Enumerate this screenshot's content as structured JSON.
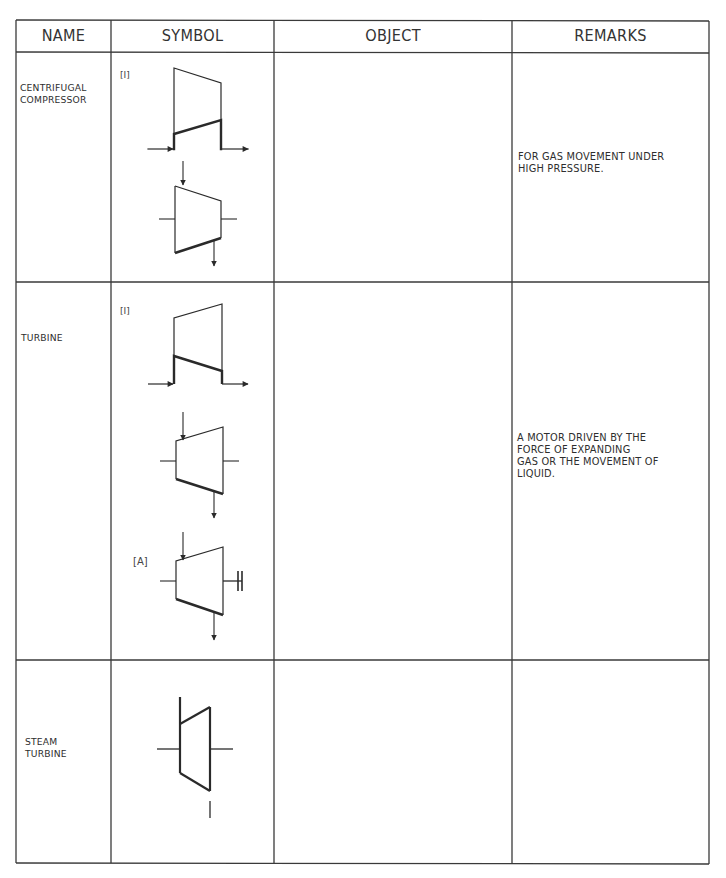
{
  "table": {
    "headers": {
      "name": "NAME",
      "symbol": "SYMBOL",
      "object": "OBJECT",
      "remarks": "REMARKS"
    },
    "rows": [
      {
        "name": "CENTRIFUGAL\nCOMPRESSOR",
        "symbol_tags": [
          "[I]"
        ],
        "object": "",
        "remarks": "FOR GAS MOVEMENT UNDER\nHIGH PRESSURE."
      },
      {
        "name": "TURBINE",
        "symbol_tags": [
          "[I]",
          "[A]"
        ],
        "object": "",
        "remarks": "A MOTOR DRIVEN BY THE\nFORCE OF EXPANDING\nGAS OR THE MOVEMENT OF\nLIQUID."
      },
      {
        "name": "STEAM\nTURBINE",
        "symbol_tags": [],
        "object": "",
        "remarks": ""
      }
    ]
  },
  "symbols": {
    "centrifugal_compressor": [
      "compressor-flow-symbol",
      "compressor-stub-symbol"
    ],
    "turbine": [
      "turbine-flow-symbol",
      "turbine-stub-symbol",
      "turbine-shaft-coupling-symbol"
    ],
    "steam_turbine": [
      "steam-turbine-symbol"
    ]
  },
  "colors": {
    "line": "#2a2a2a",
    "text": "#2e2e2e",
    "background": "#ffffff"
  }
}
